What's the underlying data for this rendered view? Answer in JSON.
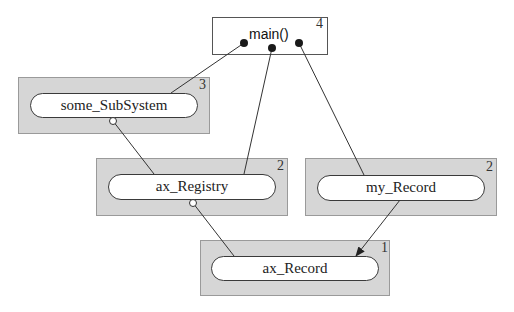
{
  "diagram": {
    "type": "dependency-graph",
    "nodes": [
      {
        "id": "main",
        "label": "main()",
        "level": "4"
      },
      {
        "id": "some_SubSystem",
        "label": "some_SubSystem",
        "level": "3"
      },
      {
        "id": "ax_Registry",
        "label": "ax_Registry",
        "level": "2"
      },
      {
        "id": "my_Record",
        "label": "my_Record",
        "level": "2"
      },
      {
        "id": "ax_Record",
        "label": "ax_Record",
        "level": "1"
      }
    ],
    "edges": [
      {
        "from": "main",
        "to": "some_SubSystem",
        "end_style": "filled-dot"
      },
      {
        "from": "main",
        "to": "ax_Registry",
        "end_style": "filled-dot"
      },
      {
        "from": "main",
        "to": "my_Record",
        "end_style": "filled-dot"
      },
      {
        "from": "some_SubSystem",
        "to": "ax_Registry",
        "end_style": "open-circle"
      },
      {
        "from": "ax_Registry",
        "to": "ax_Record",
        "end_style": "open-circle"
      },
      {
        "from": "my_Record",
        "to": "ax_Record",
        "end_style": "arrow"
      }
    ],
    "colors": {
      "package_fill": "#d6d6d6",
      "component_fill": "#ffffff",
      "line": "#333333"
    }
  }
}
